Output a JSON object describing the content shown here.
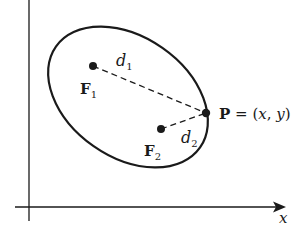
{
  "figure": {
    "axes": {
      "x_label": "x",
      "y_axis_x": 29,
      "x_axis_y": 207
    },
    "ellipse": {
      "cx": 128,
      "cy": 97,
      "rx": 88,
      "ry": 60,
      "rotation_deg": 35,
      "stroke": "#1a1a1a"
    },
    "foci": [
      {
        "id": "F1",
        "label": "F",
        "subscript": "1",
        "x": 93,
        "y": 66
      },
      {
        "id": "F2",
        "label": "F",
        "subscript": "2",
        "x": 161,
        "y": 129
      }
    ],
    "point": {
      "label": "P",
      "equals": " = (",
      "x_var": "x",
      "comma": ", ",
      "y_var": "y",
      "close": ")",
      "x": 206,
      "y": 113
    },
    "distances": [
      {
        "label": "d",
        "subscript": "1"
      },
      {
        "label": "d",
        "subscript": "2"
      }
    ]
  }
}
